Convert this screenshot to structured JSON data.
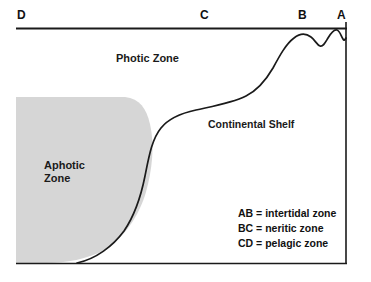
{
  "diagram": {
    "point_labels": [
      {
        "id": "label-d",
        "text": "D"
      },
      {
        "id": "label-c",
        "text": "C"
      },
      {
        "id": "label-b",
        "text": "B"
      },
      {
        "id": "label-a",
        "text": "A"
      }
    ],
    "regions": {
      "photic": "Photic Zone",
      "aphotic": "Aphotic\nZone",
      "shelf": "Continental Shelf"
    },
    "legend": [
      {
        "key": "AB",
        "text": "AB = intertidal zone"
      },
      {
        "key": "BC",
        "text": "BC = neritic zone"
      },
      {
        "key": "CD",
        "text": "CD = pelagic zone"
      }
    ],
    "colors": {
      "aphotic_fill": "#d6d6d6",
      "line": "#1a1a1a",
      "background": "#ffffff",
      "text": "#111111"
    }
  }
}
